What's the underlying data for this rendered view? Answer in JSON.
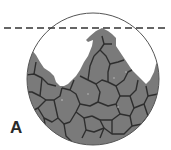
{
  "figure": {
    "panel_label": "A",
    "colors": {
      "cell_fill": "#7a7a7a",
      "cell_border": "#2e2e2e",
      "circle_outline": "#555555",
      "dashed_line": "#333333",
      "background": "#ffffff"
    },
    "circle": {
      "cx": 93,
      "cy": 79,
      "r": 66
    },
    "dashed_line": {
      "y": 28,
      "x1": 4,
      "x2": 167
    }
  }
}
